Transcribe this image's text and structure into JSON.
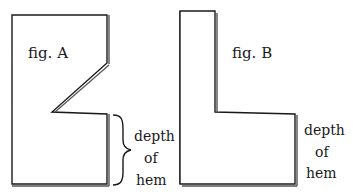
{
  "figures": [
    {
      "id": "A",
      "label": "fig. A",
      "annotation": {
        "lines": [
          "depth",
          "of",
          "hem"
        ],
        "bracket": "curly-brace"
      }
    },
    {
      "id": "B",
      "label": "fig. B",
      "annotation": {
        "lines": [
          "depth",
          "of",
          "hem"
        ],
        "bracket": "none"
      }
    }
  ],
  "colors": {
    "line": "#1a1a1a",
    "shadow": "#555555",
    "background": "#ffffff"
  }
}
